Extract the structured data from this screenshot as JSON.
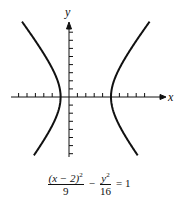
{
  "chart_data": {
    "type": "line",
    "title": "",
    "xlabel": "x",
    "ylabel": "y",
    "equation": "(x − 2)²/9 − y²/16 = 1",
    "equation_parts": {
      "num1": "(x − 2)",
      "num1_exp": "2",
      "den1": "9",
      "minus": "−",
      "num2": "y",
      "num2_exp": "2",
      "den2": "16",
      "rhs": "= 1"
    },
    "curve": "hyperbola",
    "center": [
      2,
      0
    ],
    "a": 3,
    "b": 4,
    "vertices": [
      [
        -1,
        0
      ],
      [
        5,
        0
      ]
    ],
    "xlim": [
      -7,
      9.5
    ],
    "ylim": [
      -7,
      8.5
    ],
    "x_ticks": [
      -6,
      -5,
      -4,
      -3,
      -2,
      -1,
      1,
      2,
      3,
      4,
      5,
      6,
      7,
      8,
      9
    ],
    "y_ticks": [
      -7,
      -6,
      -5,
      -4,
      -3,
      -2,
      -1,
      1,
      2,
      3,
      4,
      5,
      6,
      7,
      8
    ],
    "grid": false,
    "legend": null
  },
  "axes": {
    "x_label": "x",
    "y_label": "y"
  },
  "caption": {
    "num1": "(x − 2)",
    "num1_exp": "2",
    "den1": "9",
    "minus": "−",
    "num2": "y",
    "num2_exp": "2",
    "den2": "16",
    "rhs": "= 1"
  }
}
